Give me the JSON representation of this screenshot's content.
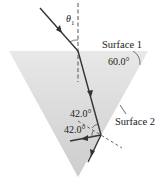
{
  "labels": {
    "theta": "θ",
    "theta_sub": "1",
    "surface1": "Surface 1",
    "surface2": "Surface 2",
    "apex_angle": "60.0°",
    "angle_incident_surface2": "42.0°",
    "angle_reflected_surface2": "42.0°"
  },
  "colors": {
    "prism_fill_top": "#e6e6e6",
    "prism_fill_bottom": "#cfcfcf",
    "ray": "#333333",
    "normal_dash": "#555555",
    "text": "#222222"
  }
}
